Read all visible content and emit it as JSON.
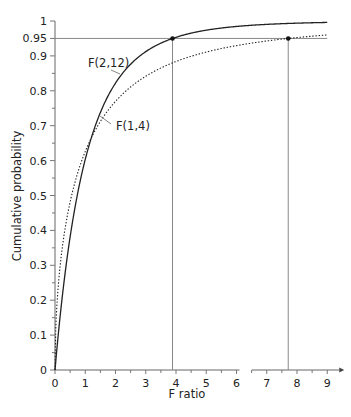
{
  "chart_data": {
    "type": "line",
    "title": "",
    "xlabel": "F ratio",
    "ylabel": "Cumulative probability",
    "xlim": [
      0,
      9
    ],
    "ylim": [
      0,
      1
    ],
    "grid": false,
    "x_ticks": [
      "0",
      "1",
      "2",
      "3",
      "4",
      "5",
      "6",
      "7",
      "8",
      "9"
    ],
    "y_ticks": [
      "0",
      "0.1",
      "0.2",
      "0.3",
      "0.4",
      "0.5",
      "0.6",
      "0.7",
      "0.8",
      "0.9",
      "0.95",
      "1"
    ],
    "axis_break": {
      "axis": "x",
      "between": [
        6.1,
        6.5
      ]
    },
    "series": [
      {
        "name": "F(2,12)",
        "style": "solid",
        "df1": 2,
        "df2": 12,
        "x": [
          0,
          0.5,
          1,
          1.5,
          2,
          2.5,
          3,
          3.5,
          3.885,
          4.5,
          5,
          6,
          7,
          8,
          9
        ],
        "values": [
          0,
          0.366,
          0.603,
          0.738,
          0.822,
          0.877,
          0.912,
          0.937,
          0.95,
          0.965,
          0.974,
          0.984,
          0.99,
          0.994,
          0.996
        ]
      },
      {
        "name": "F(1,4)",
        "style": "dotted",
        "df1": 1,
        "df2": 4,
        "x": [
          0,
          0.5,
          1,
          1.5,
          2,
          2.5,
          3,
          4,
          5,
          6,
          7,
          7.71,
          8,
          9
        ],
        "values": [
          0,
          0.482,
          0.626,
          0.712,
          0.77,
          0.811,
          0.842,
          0.884,
          0.911,
          0.93,
          0.943,
          0.95,
          0.952,
          0.96
        ]
      }
    ],
    "annotations": [
      {
        "type": "hline",
        "y": 0.95,
        "label": "0.95"
      },
      {
        "type": "vline",
        "x": 3.885,
        "from_y": 0,
        "to_y": 0.95,
        "series": "F(2,12)",
        "marker": "dot"
      },
      {
        "type": "vline",
        "x": 7.71,
        "from_y": 0,
        "to_y": 0.95,
        "series": "F(1,4)",
        "marker": "dot"
      }
    ],
    "curve_labels": [
      {
        "text": "F(2,12)",
        "series": "F(2,12)"
      },
      {
        "text": "F(1,4)",
        "series": "F(1,4)"
      }
    ]
  }
}
